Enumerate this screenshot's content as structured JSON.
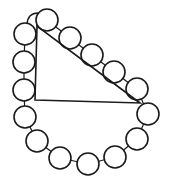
{
  "figure": {
    "stroke_color": "#1a1a1a",
    "fill_color": "#ffffff",
    "background_color": "#ffffff",
    "bead_radius": 11,
    "triangle": {
      "vertices": [
        {
          "name": "top",
          "x": 37,
          "y": 26
        },
        {
          "name": "right-angle",
          "x": 35,
          "y": 100
        },
        {
          "name": "right",
          "x": 140,
          "y": 103
        }
      ]
    },
    "beads": [
      {
        "x": 47,
        "y": 20
      },
      {
        "x": 70,
        "y": 38
      },
      {
        "x": 92,
        "y": 55
      },
      {
        "x": 114,
        "y": 72
      },
      {
        "x": 137,
        "y": 89
      },
      {
        "x": 148,
        "y": 114
      },
      {
        "x": 137,
        "y": 139
      },
      {
        "x": 115,
        "y": 157
      },
      {
        "x": 88,
        "y": 164
      },
      {
        "x": 60,
        "y": 158
      },
      {
        "x": 37,
        "y": 141
      },
      {
        "x": 25,
        "y": 117
      },
      {
        "x": 24,
        "y": 90
      },
      {
        "x": 24,
        "y": 62
      },
      {
        "x": 25,
        "y": 34
      }
    ],
    "bead_count": 15
  }
}
